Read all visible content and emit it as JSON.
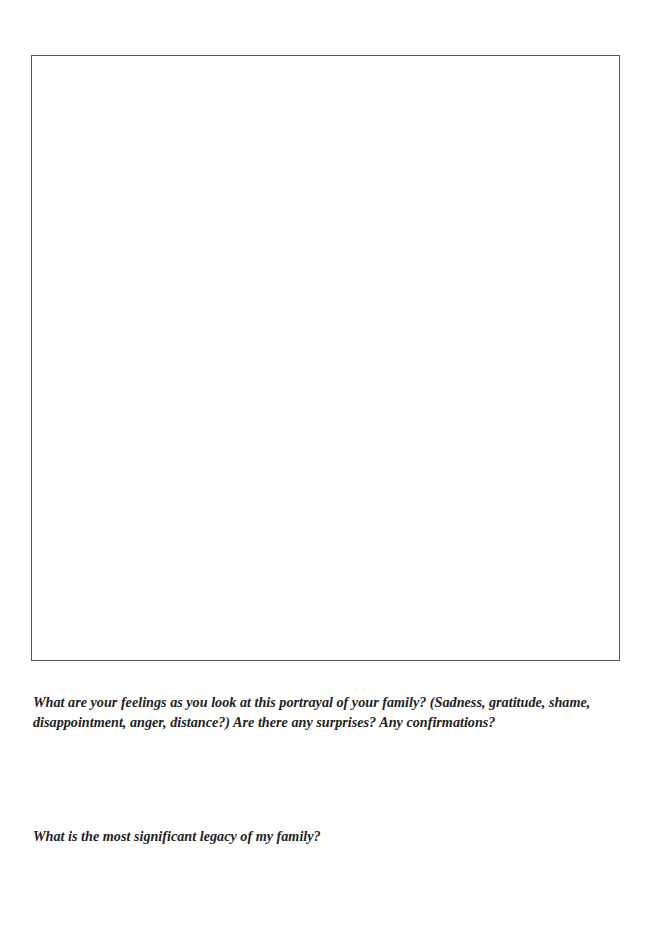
{
  "worksheet": {
    "drawing_area_label": "",
    "questions": [
      {
        "text": "What are your feelings as you look at this portrayal of your family? (Sadness, gratitude, shame, disappointment, anger, distance?) Are there any surprises? Any confirmations?"
      },
      {
        "text": "What is the most significant legacy of my family?"
      }
    ]
  },
  "colors": {
    "border": "#555555",
    "text": "#222222",
    "background": "#ffffff"
  }
}
